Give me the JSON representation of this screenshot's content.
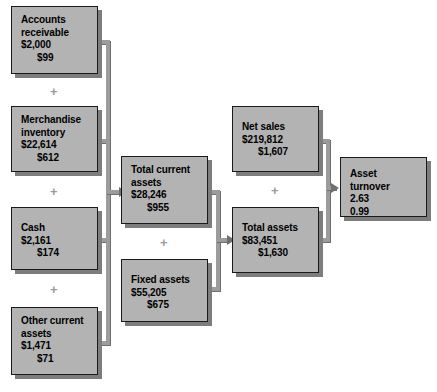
{
  "diagram": {
    "colors": {
      "node_fill": "#b3b3b3",
      "node_border": "#1a1a1a",
      "node_shadow": "#7d7d7d",
      "connector": "#9c9c9c",
      "operator": "#9a9a9a",
      "background": "#ffffff"
    },
    "nodes": [
      {
        "id": "accounts-receivable",
        "label": "Accounts\nreceivable",
        "value1": "$2,000",
        "value2": "$99"
      },
      {
        "id": "merchandise-inventory",
        "label": "Merchandise\ninventory",
        "value1": "$22,614",
        "value2": "$612"
      },
      {
        "id": "cash",
        "label": "Cash",
        "value1": "$2,161",
        "value2": "$174"
      },
      {
        "id": "other-current-assets",
        "label": "Other current\nassets",
        "value1": "$1,471",
        "value2": "$71"
      },
      {
        "id": "total-current-assets",
        "label": "Total current\nassets",
        "value1": "$28,246",
        "value2": "$955"
      },
      {
        "id": "fixed-assets",
        "label": "Fixed assets",
        "value1": "$55,205",
        "value2": "$675"
      },
      {
        "id": "net-sales",
        "label": "Net sales",
        "value1": "$219,812",
        "value2": "$1,607"
      },
      {
        "id": "total-assets",
        "label": "Total assets",
        "value1": "$83,451",
        "value2": "$1,630"
      },
      {
        "id": "asset-turnover",
        "label": "Asset turnover",
        "value1": "2.63",
        "value2": "0.99"
      }
    ],
    "operators": [
      {
        "id": "op-ar-mi",
        "symbol": "+"
      },
      {
        "id": "op-mi-cash",
        "symbol": "+"
      },
      {
        "id": "op-cash-oca",
        "symbol": "+"
      },
      {
        "id": "op-tca-fa",
        "symbol": "+"
      },
      {
        "id": "op-ns-ta",
        "symbol": "+"
      }
    ]
  }
}
